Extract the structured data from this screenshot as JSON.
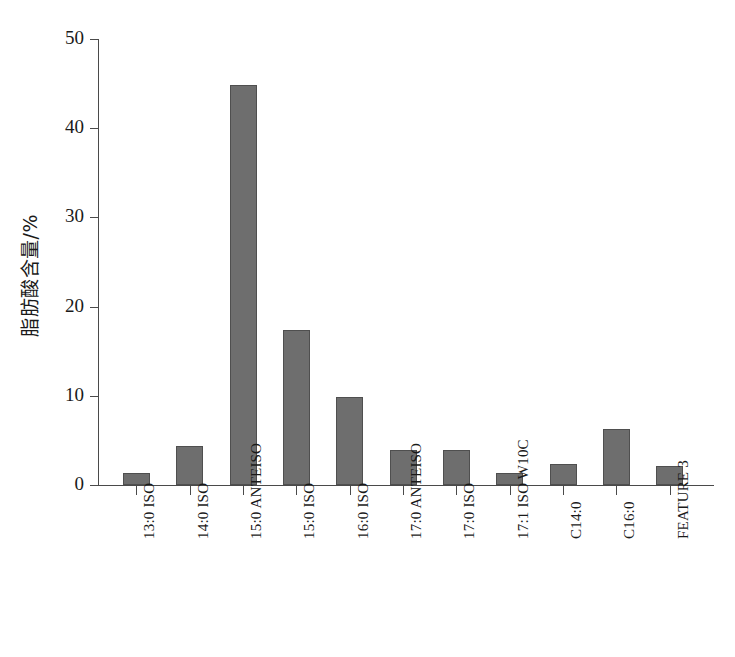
{
  "chart_data": {
    "type": "bar",
    "title": "",
    "xlabel": "",
    "ylabel": "脂肪酸含量/%",
    "ylim": [
      0,
      50
    ],
    "yticks": [
      0,
      10,
      20,
      30,
      40,
      50
    ],
    "ytick_labels": [
      "0",
      "10",
      "20",
      "30",
      "40",
      "50"
    ],
    "grid": false,
    "legend": null,
    "bar_color": "#6e6e6e",
    "bar_edge_color": "#4f4f4f",
    "axis_color": "#4a4a4a",
    "categories": [
      "13:0 ISO",
      "14:0 ISO",
      "15:0 ANTEISO",
      "15:0 ISO",
      "16:0 ISO",
      "17:0 ANTEISO",
      "17:0 ISO",
      "17:1 ISO W10C",
      "C14:0",
      "C16:0",
      "FEATURE 3"
    ],
    "values": [
      1.3,
      4.4,
      44.8,
      17.4,
      9.9,
      3.9,
      3.9,
      1.4,
      2.4,
      6.3,
      2.1
    ]
  }
}
